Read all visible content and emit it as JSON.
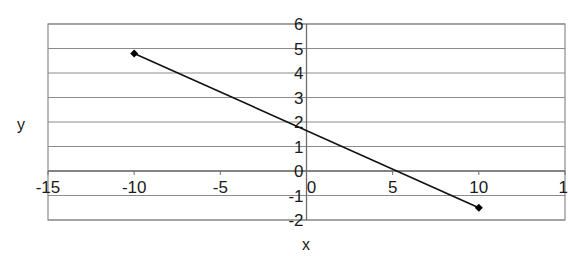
{
  "chart_data": {
    "type": "line",
    "title": "",
    "xlabel": "x",
    "ylabel": "y",
    "xlim": [
      -15,
      15
    ],
    "ylim": [
      -2,
      6
    ],
    "x_ticks": [
      -15,
      -10,
      -5,
      0,
      5,
      10,
      15
    ],
    "x_tick_labels": [
      "-15",
      "-10",
      "-5",
      "0",
      "5",
      "10",
      "1"
    ],
    "y_ticks": [
      -2,
      -1,
      0,
      1,
      2,
      3,
      4,
      5,
      6
    ],
    "y_tick_labels": [
      "-2",
      "-1",
      "0",
      "1",
      "2",
      "3",
      "4",
      "5",
      "6"
    ],
    "grid": {
      "horizontal": true,
      "vertical": false
    },
    "legend": null,
    "series": [
      {
        "name": "Series 1",
        "marker": "diamond",
        "color": "#000000",
        "points": [
          {
            "x": -10,
            "y": 4.8
          },
          {
            "x": 10,
            "y": -1.5
          }
        ]
      }
    ]
  },
  "colors": {
    "gridline": "#8c8c8c",
    "axis": "#6e6e6e",
    "line": "#111111",
    "text": "#1a1a1a"
  }
}
